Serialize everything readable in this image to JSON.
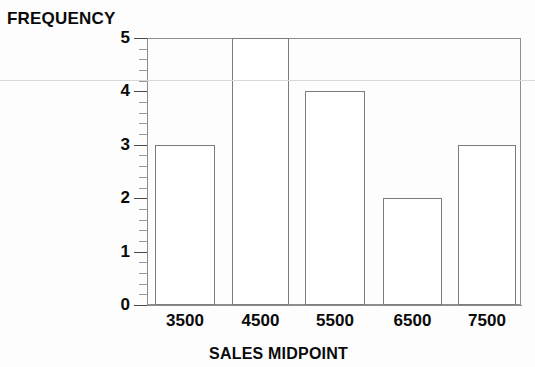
{
  "chart_data": {
    "type": "bar",
    "title": "",
    "subtitle": "",
    "xlabel": "SALES MIDPOINT",
    "ylabel": "FREQUENCY",
    "categories": [
      "3500",
      "4500",
      "5500",
      "6500",
      "7500"
    ],
    "values": [
      3,
      5,
      4,
      2,
      3
    ],
    "series": [
      {
        "name": "Frequency",
        "values": [
          3,
          5,
          4,
          2,
          3
        ]
      }
    ],
    "ylim": [
      0,
      5
    ],
    "xlim": [
      3000,
      8000
    ],
    "y_ticks": [
      0,
      1,
      2,
      3,
      4,
      5
    ],
    "y_tick_labels": [
      "0",
      "1",
      "2",
      "3",
      "4",
      "5"
    ],
    "y_minor_tick_interval": 0.2,
    "x_tick_labels": [
      "3500",
      "4500",
      "5500",
      "6500",
      "7500"
    ],
    "grid": false,
    "legend": null,
    "legend_position": "none",
    "bar_fill_color": "#ffffff",
    "bar_edge_color": "#7c7c7c",
    "axis_color": "#8d8d8d",
    "text_color": "#0a0a0a",
    "annotations": []
  },
  "axes": {
    "y_title": "FREQUENCY",
    "x_title": "SALES MIDPOINT",
    "y_tick_labels": [
      "5",
      "4",
      "3",
      "2",
      "1",
      "0"
    ],
    "x_tick_labels": [
      "3500",
      "4500",
      "5500",
      "6500",
      "7500"
    ]
  }
}
